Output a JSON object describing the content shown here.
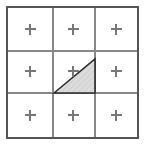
{
  "figure": {
    "type": "geometry-diagram",
    "canvas": {
      "width": 146,
      "height": 145
    },
    "background_color": "#ffffff"
  },
  "grid": {
    "rows": 3,
    "columns": 3,
    "cell_count": 9,
    "outer_border": {
      "x": 7,
      "y": 7,
      "width": 131,
      "height": 131,
      "color": "#555555",
      "stroke_width": 1.4
    },
    "inner_line_color": "#888888",
    "inner_line_width": 1.1,
    "vertical_lines_x": [
      53,
      95
    ],
    "horizontal_lines_y": [
      51,
      93
    ],
    "cell_fill_color": "#ffffff"
  },
  "markers": {
    "glyph": "plus",
    "icon_name": "plus-marker-icon",
    "color": "#777777",
    "stroke_width": 1.1,
    "arm_length": 5.5,
    "positions": [
      {
        "id": "r1c1",
        "row": 1,
        "column": 1,
        "x": 30,
        "y": 29
      },
      {
        "id": "r1c2",
        "row": 1,
        "column": 2,
        "x": 73,
        "y": 29
      },
      {
        "id": "r1c3",
        "row": 1,
        "column": 3,
        "x": 116,
        "y": 29
      },
      {
        "id": "r2c1",
        "row": 2,
        "column": 1,
        "x": 30,
        "y": 71
      },
      {
        "id": "r2c2",
        "row": 2,
        "column": 2,
        "x": 73,
        "y": 71
      },
      {
        "id": "r2c3",
        "row": 2,
        "column": 3,
        "x": 116,
        "y": 71
      },
      {
        "id": "r3c1",
        "row": 3,
        "column": 1,
        "x": 30,
        "y": 115
      },
      {
        "id": "r3c2",
        "row": 3,
        "column": 2,
        "x": 73,
        "y": 115
      },
      {
        "id": "r3c3",
        "row": 3,
        "column": 3,
        "x": 116,
        "y": 115
      }
    ]
  },
  "triangle": {
    "shape": "right-triangle",
    "located_in_cell": "r2c2",
    "vertices": [
      {
        "name": "bottom-left",
        "x": 54,
        "y": 93
      },
      {
        "name": "top-right",
        "x": 95,
        "y": 59
      },
      {
        "name": "bottom-right",
        "x": 95,
        "y": 93
      }
    ],
    "points_attr": "54,93 95,59 95,93",
    "fill_color": "#d7d7d7",
    "stroke_color": "#2b2b2b",
    "stroke_width": 1.6,
    "hatch_pattern": "fine-diagonal",
    "hatch_color": "#b8b8b8"
  }
}
